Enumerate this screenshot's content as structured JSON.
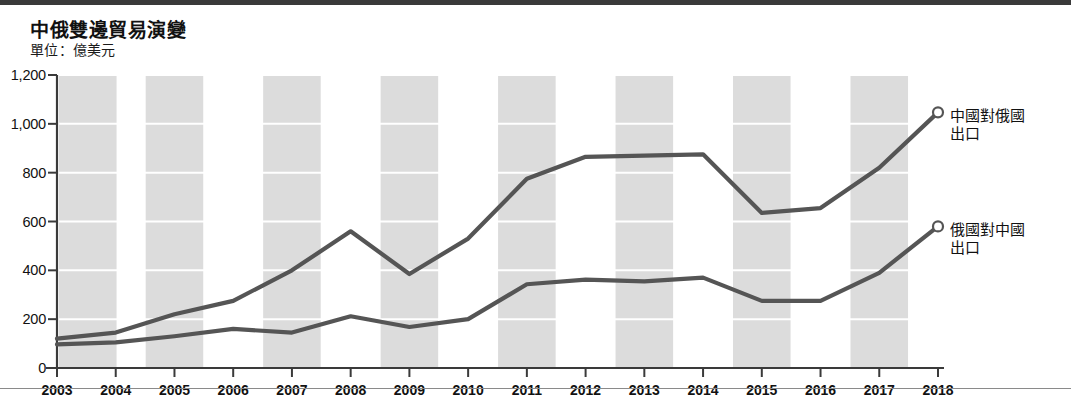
{
  "header": {
    "title": "中俄雙邊貿易演變",
    "subtitle": "單位：億美元"
  },
  "legend": {
    "series1_line1": "中國對俄國",
    "series1_line2": "出口",
    "series2_line1": "俄國對中國",
    "series2_line2": "出口"
  },
  "colors": {
    "line": "#555555",
    "band": "#dcdcdc",
    "axis": "#3a3a3a",
    "text": "#111111",
    "background": "#ffffff",
    "gridline": "#ffffff"
  },
  "chart_data": {
    "type": "line",
    "title": "中俄雙邊貿易演變",
    "subtitle": "單位：億美元",
    "xlabel": "",
    "ylabel": "億美元",
    "ylim": [
      0,
      1200
    ],
    "yticks": [
      0,
      200,
      400,
      600,
      800,
      1000,
      1200
    ],
    "ytick_labels": [
      "0",
      "200",
      "400",
      "600",
      "800",
      "1,000",
      "1,200"
    ],
    "grid": true,
    "legend_position": "right-inline-end-of-line",
    "categories": [
      2003,
      2004,
      2005,
      2006,
      2007,
      2008,
      2009,
      2010,
      2011,
      2012,
      2013,
      2014,
      2015,
      2016,
      2017,
      2018
    ],
    "xtick_labels": [
      "2003",
      "2004",
      "2005",
      "2006",
      "2007",
      "2008",
      "2009",
      "2010",
      "2011",
      "2012",
      "2013",
      "2014",
      "2015",
      "2016",
      "2017",
      "2018"
    ],
    "series": [
      {
        "name": "中國對俄國出口",
        "color": "#555555",
        "end_marker": true,
        "values": [
          120,
          145,
          220,
          275,
          400,
          560,
          385,
          530,
          775,
          865,
          870,
          875,
          635,
          655,
          820,
          1047
        ]
      },
      {
        "name": "俄國對中國出口",
        "color": "#555555",
        "end_marker": true,
        "values": [
          97,
          105,
          130,
          160,
          145,
          212,
          168,
          200,
          343,
          362,
          355,
          370,
          275,
          275,
          390,
          580
        ]
      }
    ]
  }
}
